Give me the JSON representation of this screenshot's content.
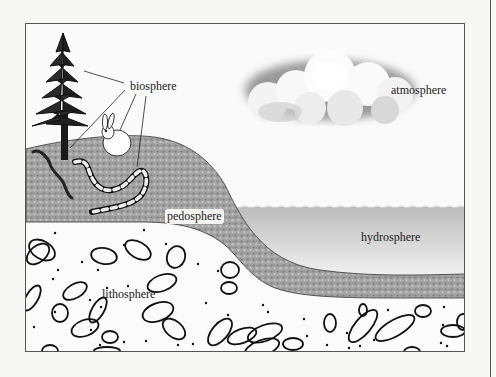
{
  "diagram": {
    "labels": {
      "biosphere": "biosphere",
      "atmosphere": "atmosphere",
      "pedosphere": "pedosphere",
      "hydrosphere": "hydrosphere",
      "lithosphere": "lithosphere"
    },
    "elements": [
      "tree",
      "rabbit",
      "snake",
      "worm",
      "cloud",
      "soil layer",
      "water body",
      "rock layer"
    ],
    "colors": {
      "soil": "#9a9a9a",
      "water": "#c8c8c8",
      "rock_bg": "#fafafa",
      "outline": "#111111",
      "frame": "#555555"
    }
  }
}
